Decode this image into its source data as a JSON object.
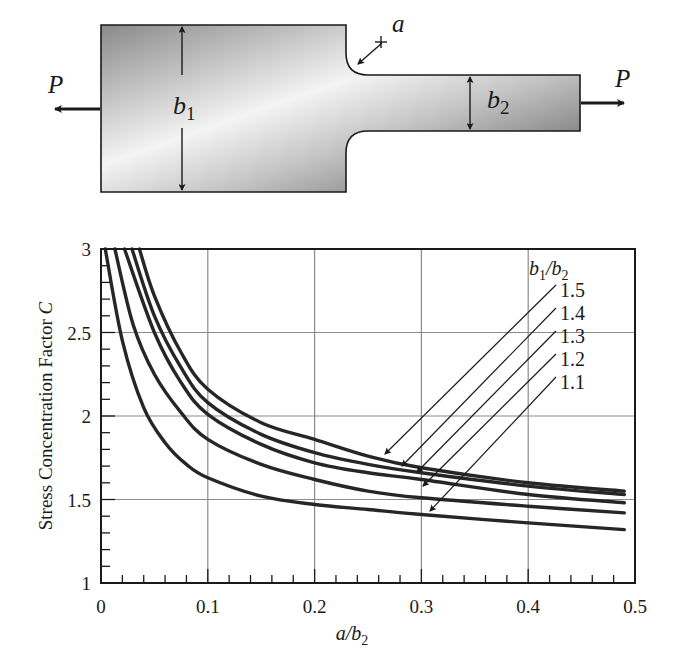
{
  "diagram": {
    "load_left": "P",
    "load_right": "P",
    "width_wide": "b",
    "width_wide_sub": "1",
    "width_narrow": "b",
    "width_narrow_sub": "2",
    "fillet_radius": "a"
  },
  "chart_data": {
    "type": "line",
    "title": "",
    "xlabel": "a/b2",
    "ylabel": "Stress Concentration Factor C",
    "xlim": [
      0,
      0.5
    ],
    "ylim": [
      1,
      3
    ],
    "x_ticks": [
      "0",
      "0.1",
      "0.2",
      "0.3",
      "0.4",
      "0.5"
    ],
    "y_ticks": [
      "1",
      "1.5",
      "2",
      "2.5",
      "3"
    ],
    "grid": true,
    "legend_title": "b1/b2",
    "legend_position": "upper right, with leader arrows to curves",
    "series": [
      {
        "name": "1.5",
        "x": [
          0.036,
          0.05,
          0.075,
          0.1,
          0.15,
          0.2,
          0.25,
          0.3,
          0.4,
          0.49
        ],
        "values": [
          3.0,
          2.72,
          2.38,
          2.16,
          1.96,
          1.86,
          1.76,
          1.69,
          1.6,
          1.55
        ]
      },
      {
        "name": "1.4",
        "x": [
          0.029,
          0.05,
          0.075,
          0.1,
          0.15,
          0.2,
          0.25,
          0.3,
          0.4,
          0.49
        ],
        "values": [
          3.0,
          2.6,
          2.29,
          2.08,
          1.89,
          1.78,
          1.71,
          1.66,
          1.58,
          1.53
        ]
      },
      {
        "name": "1.3",
        "x": [
          0.022,
          0.05,
          0.075,
          0.1,
          0.15,
          0.2,
          0.25,
          0.3,
          0.4,
          0.49
        ],
        "values": [
          3.0,
          2.5,
          2.2,
          2.01,
          1.83,
          1.72,
          1.66,
          1.62,
          1.53,
          1.48
        ]
      },
      {
        "name": "1.2",
        "x": [
          0.013,
          0.03,
          0.05,
          0.075,
          0.1,
          0.15,
          0.2,
          0.25,
          0.3,
          0.4,
          0.49
        ],
        "values": [
          3.0,
          2.55,
          2.25,
          2.02,
          1.86,
          1.71,
          1.62,
          1.55,
          1.51,
          1.46,
          1.42
        ]
      },
      {
        "name": "1.1",
        "x": [
          0.004,
          0.02,
          0.04,
          0.06,
          0.08,
          0.1,
          0.15,
          0.2,
          0.25,
          0.3,
          0.4,
          0.49
        ],
        "values": [
          3.0,
          2.45,
          2.05,
          1.84,
          1.71,
          1.63,
          1.52,
          1.47,
          1.44,
          1.41,
          1.36,
          1.32
        ]
      }
    ]
  }
}
